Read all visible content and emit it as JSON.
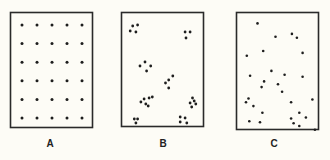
{
  "figure": {
    "panels": [
      {
        "id": "A",
        "label": "A",
        "pattern": "uniform",
        "points": [
          [
            0.0,
            0.0
          ],
          [
            0.25,
            0.0
          ],
          [
            0.5,
            0.0
          ],
          [
            0.75,
            0.0
          ],
          [
            1.0,
            0.0
          ],
          [
            0.0,
            0.2
          ],
          [
            0.25,
            0.2
          ],
          [
            0.5,
            0.2
          ],
          [
            0.75,
            0.2
          ],
          [
            1.0,
            0.2
          ],
          [
            0.0,
            0.4
          ],
          [
            0.25,
            0.4
          ],
          [
            0.5,
            0.4
          ],
          [
            0.75,
            0.4
          ],
          [
            1.0,
            0.4
          ],
          [
            0.0,
            0.6
          ],
          [
            0.25,
            0.6
          ],
          [
            0.5,
            0.6
          ],
          [
            0.75,
            0.6
          ],
          [
            1.0,
            0.6
          ],
          [
            0.0,
            0.8
          ],
          [
            0.25,
            0.8
          ],
          [
            0.5,
            0.8
          ],
          [
            0.75,
            0.8
          ],
          [
            1.0,
            0.8
          ],
          [
            0.0,
            1.0
          ],
          [
            0.25,
            1.0
          ],
          [
            0.5,
            1.0
          ],
          [
            0.75,
            1.0
          ],
          [
            1.0,
            1.0
          ]
        ]
      },
      {
        "id": "B",
        "label": "B",
        "pattern": "clumped",
        "points": [
          [
            0.13,
            0.13
          ],
          [
            0.19,
            0.12
          ],
          [
            0.1,
            0.18
          ],
          [
            0.17,
            0.19
          ],
          [
            0.77,
            0.19
          ],
          [
            0.83,
            0.19
          ],
          [
            0.78,
            0.25
          ],
          [
            0.3,
            0.58
          ],
          [
            0.22,
            0.53
          ],
          [
            0.35,
            0.53
          ],
          [
            0.28,
            0.49
          ],
          [
            0.57,
            0.67
          ],
          [
            0.62,
            0.63
          ],
          [
            0.53,
            0.7
          ],
          [
            0.57,
            0.75
          ],
          [
            0.27,
            0.86
          ],
          [
            0.33,
            0.85
          ],
          [
            0.37,
            0.84
          ],
          [
            0.23,
            0.89
          ],
          [
            0.29,
            0.91
          ],
          [
            0.32,
            0.93
          ],
          [
            0.86,
            0.85
          ],
          [
            0.88,
            0.88
          ],
          [
            0.83,
            0.9
          ],
          [
            0.9,
            0.91
          ],
          [
            0.85,
            0.94
          ],
          [
            0.15,
            1.06
          ],
          [
            0.19,
            1.06
          ],
          [
            0.17,
            1.1
          ],
          [
            0.71,
            1.04
          ],
          [
            0.77,
            1.05
          ],
          [
            0.71,
            1.09
          ],
          [
            0.79,
            1.1
          ]
        ]
      },
      {
        "id": "C",
        "label": "C",
        "pattern": "random",
        "points": [
          [
            0.25,
            0.11
          ],
          [
            0.47,
            0.25
          ],
          [
            0.67,
            0.22
          ],
          [
            0.73,
            0.26
          ],
          [
            0.12,
            0.45
          ],
          [
            0.32,
            0.4
          ],
          [
            0.8,
            0.42
          ],
          [
            0.42,
            0.61
          ],
          [
            0.58,
            0.65
          ],
          [
            0.8,
            0.67
          ],
          [
            0.16,
            0.66
          ],
          [
            0.33,
            0.72
          ],
          [
            0.3,
            0.78
          ],
          [
            0.5,
            0.75
          ],
          [
            0.55,
            0.83
          ],
          [
            0.14,
            0.9
          ],
          [
            0.11,
            0.94
          ],
          [
            0.66,
            0.94
          ],
          [
            0.92,
            0.91
          ],
          [
            0.2,
            0.98
          ],
          [
            0.31,
            1.05
          ],
          [
            0.76,
            1.05
          ],
          [
            0.84,
            1.1
          ],
          [
            0.66,
            1.11
          ],
          [
            0.69,
            1.16
          ],
          [
            0.76,
            1.19
          ],
          [
            0.15,
            1.14
          ],
          [
            0.28,
            1.15
          ],
          [
            0.95,
            1.23
          ]
        ]
      }
    ]
  }
}
